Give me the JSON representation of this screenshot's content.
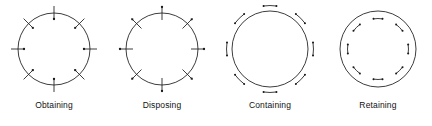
{
  "figure": {
    "title": "",
    "background_color": "#ffffff",
    "stroke_color": "#1a1a1a",
    "width": 432,
    "height": 126,
    "panel_count": 4
  },
  "chart_data": {
    "type": "diagram",
    "title": "",
    "xlabel": "",
    "ylabel": "",
    "categories": [
      "Obtaining",
      "Disposing",
      "Containing",
      "Retaining"
    ],
    "mark_angles_deg": [
      90,
      45,
      0,
      315,
      270,
      225,
      180,
      135
    ],
    "marks_per_circle": 8,
    "panels": [
      {
        "label": "Obtaining",
        "index": 0,
        "center_x": 54,
        "center_y": 47,
        "radius": 36,
        "mark_style": "radial-tick-with-inner-dot",
        "tick_inner_extent": -7,
        "tick_outer_extent": 7,
        "dot_side": "inside",
        "dot_offset": -6,
        "dot_radius": 1.15,
        "arc_marks": false
      },
      {
        "label": "Disposing",
        "index": 1,
        "center_x": 54,
        "center_y": 47,
        "radius": 36,
        "mark_style": "radial-tick-with-outer-dot",
        "tick_inner_extent": -7,
        "tick_outer_extent": 7,
        "dot_side": "outside",
        "dot_offset": 6,
        "dot_radius": 1.15,
        "arc_marks": false
      },
      {
        "label": "Containing",
        "index": 2,
        "center_x": 54,
        "center_y": 47,
        "radius": 38,
        "mark_style": "outer-arc-bracket-with-dots",
        "dot_side": "outside",
        "arc_offset": 5.5,
        "arc_span_deg": 17,
        "arc_radius": 7,
        "dot_radius": 1.0,
        "arc_marks": true,
        "arc_opening": "toward-circle"
      },
      {
        "label": "Retaining",
        "index": 3,
        "center_x": 54,
        "center_y": 47,
        "radius": 38,
        "mark_style": "inner-arc-bracket-with-dots",
        "dot_side": "inside",
        "arc_offset": -7.5,
        "arc_span_deg": 17,
        "arc_radius": 7,
        "dot_radius": 1.0,
        "arc_marks": true,
        "arc_opening": "toward-circle"
      }
    ]
  },
  "labels": {
    "obtaining": "Obtaining",
    "disposing": "Disposing",
    "containing": "Containing",
    "retaining": "Retaining"
  }
}
